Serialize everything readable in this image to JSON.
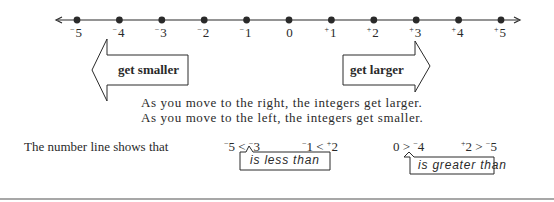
{
  "number_line": {
    "min": -5,
    "max": 5,
    "points": [
      {
        "value": -5,
        "sign": "−",
        "digit": "5"
      },
      {
        "value": -4,
        "sign": "−",
        "digit": "4"
      },
      {
        "value": -3,
        "sign": "−",
        "digit": "3"
      },
      {
        "value": -2,
        "sign": "−",
        "digit": "2"
      },
      {
        "value": -1,
        "sign": "−",
        "digit": "1"
      },
      {
        "value": 0,
        "sign": "",
        "digit": "0"
      },
      {
        "value": 1,
        "sign": "+",
        "digit": "1"
      },
      {
        "value": 2,
        "sign": "+",
        "digit": "2"
      },
      {
        "value": 3,
        "sign": "+",
        "digit": "3"
      },
      {
        "value": 4,
        "sign": "+",
        "digit": "4"
      },
      {
        "value": 5,
        "sign": "+",
        "digit": "5"
      }
    ],
    "arrows_both_ends": true
  },
  "direction_arrows": {
    "left": {
      "label": "get smaller",
      "direction": "left"
    },
    "right": {
      "label": "get larger",
      "direction": "right"
    }
  },
  "explanation": {
    "line1": "As you move to the right, the integers get larger.",
    "line2": "As you move to the left, the integers get smaller."
  },
  "comparisons": {
    "lead": "The number line shows that",
    "items": [
      {
        "left_sign": "−",
        "left": "5",
        "op": "<",
        "right_sign": "−",
        "right": "3"
      },
      {
        "left_sign": "−",
        "left": "1",
        "op": "<",
        "right_sign": "+",
        "right": "2"
      },
      {
        "left_sign": "",
        "left": "0",
        "op": ">",
        "right_sign": "−",
        "right": "4"
      },
      {
        "left_sign": "+",
        "left": "2",
        "op": ">",
        "right_sign": "−",
        "right": "5"
      }
    ],
    "less_than_callout": "is less than",
    "greater_than_callout": "is greater than"
  },
  "colors": {
    "ink": "#2a2a2a",
    "rule": "#8a8a8a",
    "background": "#ffffff"
  }
}
